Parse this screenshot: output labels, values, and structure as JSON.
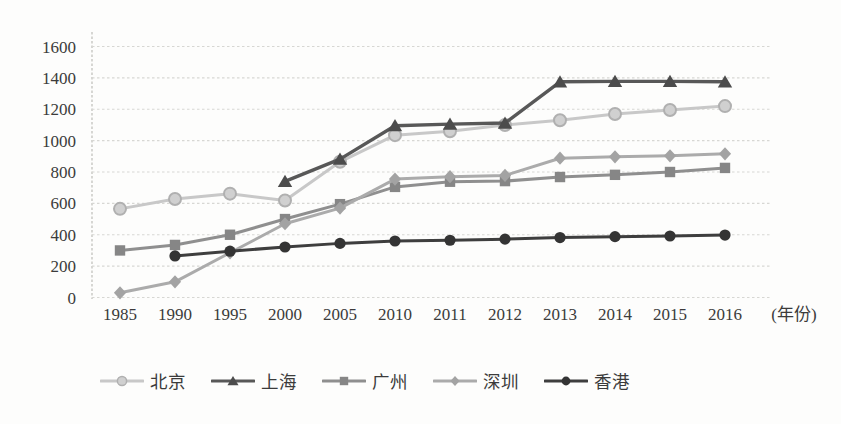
{
  "figure": {
    "background_color": "#fdfdfc",
    "text_color": "#3b3b3b",
    "gridline_color": "#d7d7d3",
    "axis_color": "#c6c6c2"
  },
  "chart_data": {
    "type": "line",
    "title": "",
    "xlabel": "(年份)",
    "ylabel": "",
    "x_categories": [
      "1985",
      "1990",
      "1995",
      "2000",
      "2005",
      "2010",
      "2011",
      "2012",
      "2013",
      "2014",
      "2015",
      "2016"
    ],
    "y_ticks": [
      "1600",
      "1400",
      "1200",
      "1000",
      "800",
      "600",
      "400",
      "200",
      "0"
    ],
    "ylim": [
      0,
      1600
    ],
    "grid": "horizontal-dashed",
    "legend_position": "bottom",
    "series": [
      {
        "key": "beijing",
        "name": "北京",
        "marker": "circle-open",
        "line_color": "#c8c8c8",
        "marker_fill": "#d0d0d0",
        "marker_stroke": "#b0b0b0",
        "values": [
          565,
          628,
          662,
          618,
          865,
          1035,
          1060,
          1100,
          1130,
          1170,
          1195,
          1220
        ]
      },
      {
        "key": "shanghai",
        "name": "上海",
        "marker": "triangle",
        "line_color": "#585858",
        "marker_fill": "#4c4c4c",
        "marker_stroke": "#4c4c4c",
        "values": [
          null,
          null,
          null,
          740,
          882,
          1095,
          1105,
          1112,
          1375,
          1378,
          1378,
          1375
        ]
      },
      {
        "key": "guangzhou",
        "name": "广州",
        "marker": "square",
        "line_color": "#8f8f8f",
        "marker_fill": "#868686",
        "marker_stroke": "#7e7e7e",
        "values": [
          300,
          335,
          400,
          500,
          595,
          705,
          738,
          742,
          768,
          782,
          800,
          826
        ]
      },
      {
        "key": "shenzhen",
        "name": "深圳",
        "marker": "diamond",
        "line_color": "#ababab",
        "marker_fill": "#a3a3a3",
        "marker_stroke": "#979797",
        "values": [
          30,
          100,
          285,
          470,
          570,
          755,
          770,
          778,
          888,
          897,
          903,
          916
        ]
      },
      {
        "key": "hongkong",
        "name": "香港",
        "marker": "circle-filled",
        "line_color": "#3e3e3e",
        "marker_fill": "#343434",
        "marker_stroke": "#343434",
        "values": [
          null,
          265,
          295,
          322,
          345,
          360,
          365,
          372,
          382,
          388,
          392,
          398
        ]
      }
    ]
  }
}
